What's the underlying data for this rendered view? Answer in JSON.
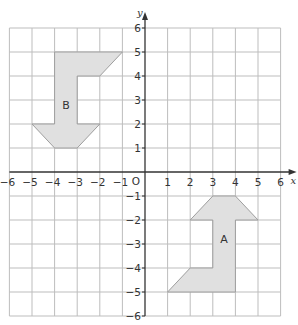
{
  "diagram": {
    "type": "coordinate-grid",
    "colors": {
      "grid": "#bdbdbd",
      "axis": "#333333",
      "shape_fill": "#e0e0e0",
      "shape_stroke": "#9e9e9e",
      "text": "#333333"
    },
    "axes": {
      "x_label": "x",
      "y_label": "y",
      "origin_label": "O",
      "x_range": [
        -6,
        6
      ],
      "y_range": [
        -6,
        6
      ],
      "x_ticks": [
        "-6",
        "-5",
        "-4",
        "-3",
        "-2",
        "-1",
        "1",
        "2",
        "3",
        "4",
        "5",
        "6"
      ],
      "y_ticks": [
        "6",
        "5",
        "4",
        "3",
        "2",
        "1",
        "-1",
        "-2",
        "-3",
        "-4",
        "-5",
        "-6"
      ]
    },
    "shapes": [
      {
        "label": "A",
        "vertices": [
          [
            3,
            -1
          ],
          [
            4,
            -1
          ],
          [
            5,
            -2
          ],
          [
            4,
            -2
          ],
          [
            4,
            -5
          ],
          [
            1,
            -5
          ],
          [
            2,
            -4
          ],
          [
            3,
            -4
          ],
          [
            3,
            -2
          ],
          [
            2,
            -2
          ]
        ],
        "label_pos": [
          3.5,
          -2.8
        ]
      },
      {
        "label": "B",
        "vertices": [
          [
            -4,
            5
          ],
          [
            -1,
            5
          ],
          [
            -2,
            4
          ],
          [
            -3,
            4
          ],
          [
            -3,
            2
          ],
          [
            -2,
            2
          ],
          [
            -3,
            1
          ],
          [
            -4,
            1
          ],
          [
            -5,
            2
          ],
          [
            -4,
            2
          ]
        ],
        "label_pos": [
          -3.5,
          2.8
        ]
      }
    ]
  }
}
